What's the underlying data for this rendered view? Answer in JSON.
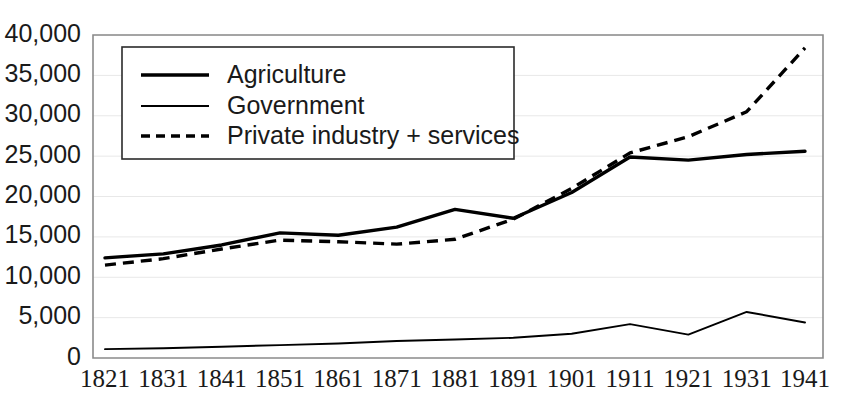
{
  "chart_data": {
    "type": "line",
    "title": "",
    "subtitle": "",
    "xlabel": "",
    "ylabel": "",
    "categories": [
      "1821",
      "1831",
      "1841",
      "1851",
      "1861",
      "1871",
      "1881",
      "1891",
      "1901",
      "1911",
      "1921",
      "1931",
      "1941"
    ],
    "x": [
      1821,
      1831,
      1841,
      1851,
      1861,
      1871,
      1881,
      1891,
      1901,
      1911,
      1921,
      1931,
      1941
    ],
    "series": [
      {
        "name": "Agriculture",
        "style": "solid-thick",
        "values": [
          12400,
          12900,
          14000,
          15500,
          15200,
          16200,
          18400,
          17300,
          20500,
          24900,
          24500,
          25200,
          25600
        ]
      },
      {
        "name": "Government",
        "style": "solid-thin",
        "values": [
          1100,
          1200,
          1400,
          1600,
          1800,
          2100,
          2300,
          2500,
          3000,
          4200,
          2900,
          5700,
          4400
        ]
      },
      {
        "name": "Private industry + services",
        "style": "dashed",
        "values": [
          11500,
          12300,
          13500,
          14600,
          14400,
          14100,
          14700,
          17200,
          21000,
          25400,
          27400,
          30500,
          38400
        ]
      }
    ],
    "ylim": [
      0,
      40000
    ],
    "yticks": [
      0,
      5000,
      10000,
      15000,
      20000,
      25000,
      30000,
      35000,
      40000
    ],
    "ytick_labels": [
      "0",
      "5,000",
      "10,000",
      "15,000",
      "20,000",
      "25,000",
      "30,000",
      "35,000",
      "40,000"
    ],
    "xtick_labels": [
      "1821",
      "1831",
      "1841",
      "1851",
      "1861",
      "1871",
      "1881",
      "1891",
      "1901",
      "1911",
      "1921",
      "1931",
      "1941"
    ],
    "grid": true,
    "grid_axis": "y",
    "legend_position": "top-left-inside",
    "legend_entries": [
      "Agriculture",
      "Government",
      "Private industry + services"
    ],
    "colors": {
      "series_stroke": "#000000",
      "gridline": "#e8e8e8",
      "axis": "#8a8a8a",
      "text": "#1a1a1a",
      "background": "#ffffff"
    }
  }
}
